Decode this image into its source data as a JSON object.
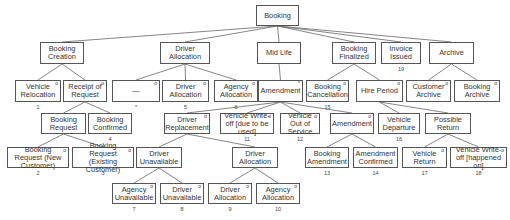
{
  "diagram": {
    "title": "Booking",
    "nodes": [
      {
        "id": "booking",
        "label": "Booking",
        "x": 256,
        "y": 5,
        "w": 43,
        "h": 21,
        "mark": "",
        "num": ""
      },
      {
        "id": "booking-creation",
        "label": "Booking Creation",
        "x": 40,
        "y": 42,
        "w": 44,
        "h": 22,
        "mark": "",
        "num": ""
      },
      {
        "id": "driver-allocation-1",
        "label": "Driver Allocation",
        "x": 160,
        "y": 42,
        "w": 50,
        "h": 22,
        "mark": "",
        "num": ""
      },
      {
        "id": "mid-life",
        "label": "Mid Life",
        "x": 257,
        "y": 42,
        "w": 44,
        "h": 22,
        "mark": "",
        "num": ""
      },
      {
        "id": "booking-finalized",
        "label": "Booking Finalized",
        "x": 332,
        "y": 42,
        "w": 44,
        "h": 22,
        "mark": "",
        "num": ""
      },
      {
        "id": "invoice-issued",
        "label": "Invoice Issued",
        "x": 381,
        "y": 42,
        "w": 40,
        "h": 22,
        "mark": "",
        "num": "19"
      },
      {
        "id": "archive",
        "label": "Archive",
        "x": 429,
        "y": 42,
        "w": 45,
        "h": 22,
        "mark": "",
        "num": ""
      },
      {
        "id": "vehicle-relocation",
        "label": "Vehicle Relocation",
        "x": 15,
        "y": 80,
        "w": 46,
        "h": 22,
        "mark": "o",
        "num": "1"
      },
      {
        "id": "receipt-of-request",
        "label": "Receipt of Request",
        "x": 63,
        "y": 80,
        "w": 44,
        "h": 22,
        "mark": "o",
        "num": ""
      },
      {
        "id": "dash",
        "label": "—",
        "x": 112,
        "y": 80,
        "w": 48,
        "h": 22,
        "mark": "o",
        "num": "*"
      },
      {
        "id": "driver-allocation-2",
        "label": "Driver Allocation",
        "x": 162,
        "y": 80,
        "w": 47,
        "h": 22,
        "mark": "o",
        "num": "5"
      },
      {
        "id": "agency-allocation-1",
        "label": "Agency Allocation",
        "x": 214,
        "y": 80,
        "w": 44,
        "h": 22,
        "mark": "o",
        "num": "6"
      },
      {
        "id": "amendment-1",
        "label": "Amendment",
        "x": 258,
        "y": 80,
        "w": 45,
        "h": 22,
        "mark": "*",
        "num": ""
      },
      {
        "id": "booking-cancellation",
        "label": "Booking Cancellation",
        "x": 306,
        "y": 80,
        "w": 43,
        "h": 22,
        "mark": "o",
        "num": "15"
      },
      {
        "id": "hire-period",
        "label": "Hire Period",
        "x": 356,
        "y": 80,
        "w": 47,
        "h": 22,
        "mark": "o",
        "num": ""
      },
      {
        "id": "customer-archive",
        "label": "Customer Archive",
        "x": 406,
        "y": 80,
        "w": 45,
        "h": 22,
        "mark": "o",
        "num": ""
      },
      {
        "id": "booking-archive",
        "label": "Booking Archive",
        "x": 454,
        "y": 80,
        "w": 46,
        "h": 22,
        "mark": "o",
        "num": ""
      },
      {
        "id": "booking-request",
        "label": "Booking Request",
        "x": 41,
        "y": 113,
        "w": 45,
        "h": 21,
        "mark": "",
        "num": ""
      },
      {
        "id": "booking-confirmed",
        "label": "Booking Confirmed",
        "x": 88,
        "y": 113,
        "w": 44,
        "h": 21,
        "mark": "",
        "num": "4"
      },
      {
        "id": "driver-replacement",
        "label": "Driver Replacement",
        "x": 164,
        "y": 113,
        "w": 46,
        "h": 21,
        "mark": "o",
        "num": ""
      },
      {
        "id": "vehicle-write-off-1",
        "label": "Vehicle Write-off [due to be used]",
        "x": 220,
        "y": 113,
        "w": 54,
        "h": 21,
        "mark": "o",
        "num": "11"
      },
      {
        "id": "vehicle-out-of-service",
        "label": "Vehicle Out of Service",
        "x": 280,
        "y": 113,
        "w": 40,
        "h": 21,
        "mark": "o",
        "num": "12"
      },
      {
        "id": "amendment-2",
        "label": "Amendment",
        "x": 330,
        "y": 113,
        "w": 44,
        "h": 21,
        "mark": "o",
        "num": ""
      },
      {
        "id": "vehicle-departure",
        "label": "Vehicle Departure",
        "x": 378,
        "y": 113,
        "w": 42,
        "h": 21,
        "mark": "",
        "num": "16"
      },
      {
        "id": "possible-return",
        "label": "Possible Return",
        "x": 425,
        "y": 113,
        "w": 46,
        "h": 21,
        "mark": "",
        "num": ""
      },
      {
        "id": "booking-request-new",
        "label": "Booking Request (New Customer)",
        "x": 7,
        "y": 147,
        "w": 62,
        "h": 21,
        "mark": "o",
        "num": "2"
      },
      {
        "id": "booking-request-existing",
        "label": "Booking Request (Existing Customer)",
        "x": 72,
        "y": 147,
        "w": 62,
        "h": 21,
        "mark": "o",
        "num": "3"
      },
      {
        "id": "driver-unavailable-1",
        "label": "Driver Unavailable",
        "x": 136,
        "y": 147,
        "w": 46,
        "h": 21,
        "mark": "",
        "num": ""
      },
      {
        "id": "driver-allocation-3",
        "label": "Driver Allocation",
        "x": 232,
        "y": 147,
        "w": 46,
        "h": 21,
        "mark": "",
        "num": ""
      },
      {
        "id": "booking-amendment",
        "label": "Booking Amendment",
        "x": 305,
        "y": 147,
        "w": 44,
        "h": 21,
        "mark": "",
        "num": "13"
      },
      {
        "id": "amendment-confirmed",
        "label": "Amendment Confirmed",
        "x": 353,
        "y": 147,
        "w": 45,
        "h": 21,
        "mark": "",
        "num": "14"
      },
      {
        "id": "vehicle-return",
        "label": "Vehicle Return",
        "x": 402,
        "y": 147,
        "w": 45,
        "h": 21,
        "mark": "o",
        "num": "17"
      },
      {
        "id": "vehicle-write-off-2",
        "label": "Vehicle Write-off [happened on]",
        "x": 450,
        "y": 147,
        "w": 57,
        "h": 21,
        "mark": "o",
        "num": "18"
      },
      {
        "id": "agency-unavailable",
        "label": "Agency Unavailable",
        "x": 112,
        "y": 183,
        "w": 44,
        "h": 21,
        "mark": "o",
        "num": "7"
      },
      {
        "id": "driver-unavailable-2",
        "label": "Driver Unavailable",
        "x": 160,
        "y": 183,
        "w": 44,
        "h": 21,
        "mark": "o",
        "num": "8"
      },
      {
        "id": "driver-allocation-4",
        "label": "Driver Allocation",
        "x": 208,
        "y": 183,
        "w": 44,
        "h": 21,
        "mark": "o",
        "num": "9"
      },
      {
        "id": "agency-allocation-2",
        "label": "Agency Allocation",
        "x": 256,
        "y": 183,
        "w": 44,
        "h": 21,
        "mark": "o",
        "num": "10"
      }
    ],
    "edges": [
      [
        "booking",
        "booking-creation"
      ],
      [
        "booking",
        "driver-allocation-1"
      ],
      [
        "booking",
        "mid-life"
      ],
      [
        "booking",
        "booking-finalized"
      ],
      [
        "booking",
        "invoice-issued"
      ],
      [
        "booking",
        "archive"
      ],
      [
        "booking-creation",
        "vehicle-relocation"
      ],
      [
        "booking-creation",
        "receipt-of-request"
      ],
      [
        "driver-allocation-1",
        "dash"
      ],
      [
        "driver-allocation-1",
        "driver-allocation-2"
      ],
      [
        "driver-allocation-1",
        "agency-allocation-1"
      ],
      [
        "mid-life",
        "amendment-1"
      ],
      [
        "booking-finalized",
        "booking-cancellation"
      ],
      [
        "booking-finalized",
        "hire-period"
      ],
      [
        "archive",
        "customer-archive"
      ],
      [
        "archive",
        "booking-archive"
      ],
      [
        "receipt-of-request",
        "booking-request"
      ],
      [
        "receipt-of-request",
        "booking-confirmed"
      ],
      [
        "amendment-1",
        "driver-replacement"
      ],
      [
        "amendment-1",
        "vehicle-write-off-1"
      ],
      [
        "amendment-1",
        "vehicle-out-of-service"
      ],
      [
        "amendment-1",
        "amendment-2"
      ],
      [
        "hire-period",
        "vehicle-departure"
      ],
      [
        "hire-period",
        "possible-return"
      ],
      [
        "booking-request",
        "booking-request-new"
      ],
      [
        "booking-request",
        "booking-request-existing"
      ],
      [
        "driver-replacement",
        "driver-unavailable-1"
      ],
      [
        "driver-replacement",
        "driver-allocation-3"
      ],
      [
        "amendment-2",
        "booking-amendment"
      ],
      [
        "amendment-2",
        "amendment-confirmed"
      ],
      [
        "possible-return",
        "vehicle-return"
      ],
      [
        "possible-return",
        "vehicle-write-off-2"
      ],
      [
        "driver-unavailable-1",
        "agency-unavailable"
      ],
      [
        "driver-unavailable-1",
        "driver-unavailable-2"
      ],
      [
        "driver-allocation-3",
        "driver-allocation-4"
      ],
      [
        "driver-allocation-3",
        "agency-allocation-2"
      ]
    ]
  }
}
